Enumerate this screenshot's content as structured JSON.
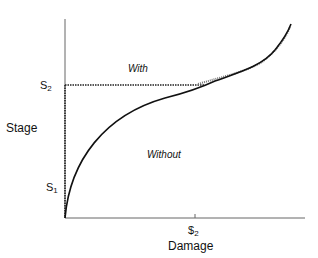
{
  "diagram": {
    "y_axis_label": "Stage",
    "x_axis_label": "Damage",
    "y_ticks": [
      {
        "base": "S",
        "sub": "2"
      },
      {
        "base": "S",
        "sub": "1"
      }
    ],
    "x_ticks": [
      {
        "base": "$",
        "sub": "2"
      }
    ],
    "region_labels": {
      "with": "With",
      "without": "Without"
    }
  }
}
